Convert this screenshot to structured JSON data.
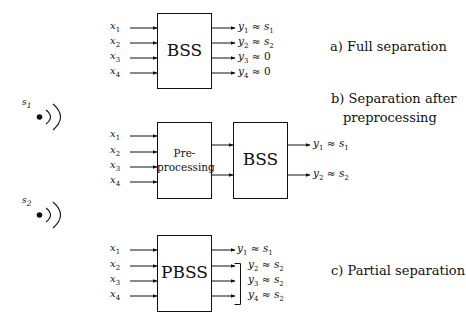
{
  "sources": [
    {
      "label": "s",
      "sub": "1"
    },
    {
      "label": "s",
      "sub": "2"
    }
  ],
  "inputs": [
    {
      "label": "x",
      "sub": "1"
    },
    {
      "label": "x",
      "sub": "2"
    },
    {
      "label": "x",
      "sub": "3"
    },
    {
      "label": "x",
      "sub": "4"
    }
  ],
  "panel_a": {
    "caption": "a) Full separation",
    "box": "BSS",
    "outputs": [
      {
        "y": "y",
        "sub": "1",
        "approx": "≈",
        "rhs": "s",
        "rhs_sub": "1"
      },
      {
        "y": "y",
        "sub": "2",
        "approx": "≈",
        "rhs": "s",
        "rhs_sub": "2"
      },
      {
        "y": "y",
        "sub": "3",
        "approx": "≈",
        "rhs": "0",
        "rhs_sub": ""
      },
      {
        "y": "y",
        "sub": "4",
        "approx": "≈",
        "rhs": "0",
        "rhs_sub": ""
      }
    ]
  },
  "panel_b": {
    "caption_line1": "b) Separation after",
    "caption_line2": "preprocessing",
    "pre_line1": "Pre-",
    "pre_line2": "processing",
    "box": "BSS",
    "outputs": [
      {
        "y": "y",
        "sub": "1",
        "approx": "≈",
        "rhs": "s",
        "rhs_sub": "1"
      },
      {
        "y": "y",
        "sub": "2",
        "approx": "≈",
        "rhs": "s",
        "rhs_sub": "2"
      }
    ]
  },
  "panel_c": {
    "caption": "c) Partial separation",
    "box": "PBSS",
    "outputs": [
      {
        "y": "y",
        "sub": "1",
        "approx": "≈",
        "rhs": "s",
        "rhs_sub": "1"
      },
      {
        "y": "y",
        "sub": "2",
        "approx": "≈",
        "rhs": "s",
        "rhs_sub": "2"
      },
      {
        "y": "y",
        "sub": "3",
        "approx": "≈",
        "rhs": "s",
        "rhs_sub": "2"
      },
      {
        "y": "y",
        "sub": "4",
        "approx": "≈",
        "rhs": "s",
        "rhs_sub": "2"
      }
    ]
  }
}
